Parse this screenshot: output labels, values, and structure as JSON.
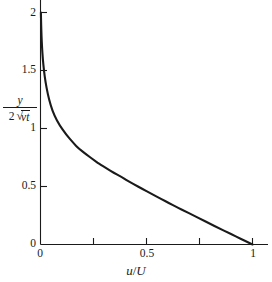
{
  "figure": {
    "background_color": "#ffffff",
    "line_color": "#1a1a1a",
    "axis_color": "#1a1a1a"
  },
  "axes": {
    "y_label_numerator": "y",
    "y_label_denominator_coefficient": "2",
    "y_label_denominator_radicand_nu": "ν",
    "y_label_denominator_radicand_t": "t",
    "x_label_numerator": "u",
    "x_label_slash": "/",
    "x_label_denominator": "U",
    "y_ticks": [
      "0",
      "0.5",
      "1",
      "1.5",
      "2"
    ],
    "x_ticks": [
      "0",
      "0.5",
      "1"
    ]
  },
  "chart_data": {
    "type": "line",
    "title": "",
    "subtitle": "",
    "xlabel": "u/U",
    "ylabel": "y / (2 sqrt(nu t))",
    "xlim": [
      0,
      1
    ],
    "ylim": [
      0,
      2
    ],
    "xticks": [
      0,
      0.5,
      1
    ],
    "xtick_labels": [
      "0",
      "0.5",
      "1"
    ],
    "xticks_minor": [
      0.25,
      0.75
    ],
    "yticks": [
      0,
      0.5,
      1,
      1.5,
      2
    ],
    "ytick_labels": [
      "0",
      "0.5",
      "1",
      "1.5",
      "2"
    ],
    "grid": false,
    "legend": false,
    "annotations": [],
    "series": [
      {
        "name": "u/U = erfc(eta)",
        "x": [
          1.0,
          0.9774,
          0.9549,
          0.9324,
          0.9099,
          0.8875,
          0.8428,
          0.7983,
          0.7544,
          0.7112,
          0.6892,
          0.6455,
          0.6039,
          0.5716,
          0.5205,
          0.4795,
          0.4397,
          0.4011,
          0.3843,
          0.3439,
          0.3173,
          0.2725,
          0.2579,
          0.2133,
          0.1791,
          0.1573,
          0.1198,
          0.0897,
          0.066,
          0.0477,
          0.0339,
          0.0237,
          0.0162,
          0.0109,
          0.0072,
          0.0047,
          0.003,
          0.0019,
          0.0011,
          0.0007,
          0.0004,
          0.0002
        ],
        "y": [
          0.0,
          0.02,
          0.04,
          0.06,
          0.08,
          0.1,
          0.14,
          0.18,
          0.22,
          0.26,
          0.28,
          0.32,
          0.36,
          0.39,
          0.44,
          0.48,
          0.52,
          0.56,
          0.58,
          0.62,
          0.65,
          0.7,
          0.72,
          0.78,
          0.83,
          0.87,
          0.95,
          1.03,
          1.11,
          1.2,
          1.3,
          1.4,
          1.5,
          1.6,
          1.7,
          1.8,
          1.9,
          2.0,
          2.1,
          2.2,
          2.3,
          2.4
        ]
      }
    ]
  }
}
